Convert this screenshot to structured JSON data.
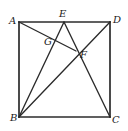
{
  "figure": {
    "stroke_color": "#2b2b2b",
    "label_color": "#1a1a1a",
    "background_color": "#ffffff",
    "square": {
      "name": "ABCD",
      "corners": [
        {
          "id": "A",
          "label": "A",
          "x": 19,
          "y": 22
        },
        {
          "id": "D",
          "label": "D",
          "x": 110,
          "y": 22
        },
        {
          "id": "C",
          "label": "C",
          "x": 110,
          "y": 117
        },
        {
          "id": "B",
          "label": "B",
          "x": 19,
          "y": 117
        }
      ]
    },
    "points": [
      {
        "id": "E",
        "label": "E",
        "x": 64,
        "y": 22
      },
      {
        "id": "F",
        "label": "F",
        "x": 76,
        "y": 51
      },
      {
        "id": "G",
        "label": "G",
        "x": 54,
        "y": 42
      }
    ],
    "segments": [
      {
        "name": "side-AD",
        "from": "A",
        "to": "D",
        "x1": 19,
        "y1": 22,
        "x2": 110,
        "y2": 22
      },
      {
        "name": "side-DC",
        "from": "D",
        "to": "C",
        "x1": 110,
        "y1": 22,
        "x2": 110,
        "y2": 117
      },
      {
        "name": "side-CB",
        "from": "C",
        "to": "B",
        "x1": 110,
        "y1": 117,
        "x2": 19,
        "y2": 117
      },
      {
        "name": "side-BA",
        "from": "B",
        "to": "A",
        "x1": 19,
        "y1": 117,
        "x2": 19,
        "y2": 22
      },
      {
        "name": "segment-BE",
        "from": "B",
        "to": "E",
        "x1": 19,
        "y1": 117,
        "x2": 64,
        "y2": 22
      },
      {
        "name": "segment-AF",
        "from": "A",
        "to": "F",
        "x1": 19,
        "y1": 22,
        "x2": 76,
        "y2": 51
      },
      {
        "name": "segment-EC",
        "from": "E",
        "to": "C",
        "x1": 64,
        "y1": 22,
        "x2": 110,
        "y2": 117
      },
      {
        "name": "diagonal-BD",
        "from": "B",
        "to": "D",
        "x1": 19,
        "y1": 117,
        "x2": 110,
        "y2": 22
      }
    ],
    "labels": [
      {
        "id": "A",
        "text": "A",
        "left": 9,
        "top": 16
      },
      {
        "id": "E",
        "text": "E",
        "left": 59,
        "top": 9
      },
      {
        "id": "D",
        "text": "D",
        "left": 113,
        "top": 15
      },
      {
        "id": "G",
        "text": "G",
        "left": 44,
        "top": 37
      },
      {
        "id": "F",
        "text": "F",
        "left": 80,
        "top": 50
      },
      {
        "id": "B",
        "text": "B",
        "left": 10,
        "top": 113
      },
      {
        "id": "C",
        "text": "C",
        "left": 112,
        "top": 115
      }
    ]
  }
}
